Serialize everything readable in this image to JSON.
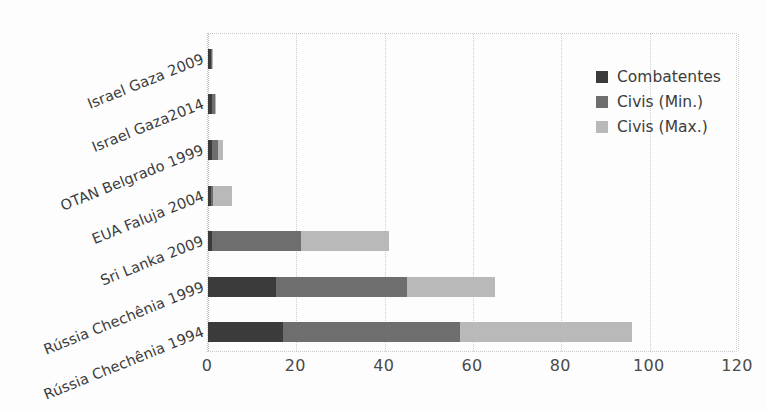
{
  "chart_data": {
    "type": "bar",
    "orientation": "horizontal",
    "stacked": true,
    "title": "",
    "subtitle": "",
    "xlabel": "",
    "ylabel": "",
    "xlim": [
      0,
      120
    ],
    "ylim": null,
    "grid": true,
    "grid_style": "dotted vertical gridlines",
    "legend_position": "top-right inside plot",
    "categories": [
      "Israel Gaza 2009",
      "Israel Gaza2014",
      "OTAN Belgrado 1999",
      "EUA Faluja 2004",
      "Sri Lanka 2009",
      "Rússia Chechênia 1999",
      "Rússia Chechênia 1994"
    ],
    "x_ticks": [
      0,
      20,
      40,
      60,
      80,
      100,
      120
    ],
    "x_tick_labels": [
      "0",
      "20",
      "40",
      "60",
      "80",
      "100",
      "120"
    ],
    "series": [
      {
        "name": "Combatentes",
        "color": "#3b3b3b",
        "values": [
          0.6,
          0.9,
          1.0,
          0.6,
          1.0,
          15.5,
          17.0
        ]
      },
      {
        "name": "Civis (Min.)",
        "color": "#6e6e6e",
        "values": [
          0.4,
          0.6,
          1.2,
          0.6,
          20.0,
          29.5,
          40.0
        ]
      },
      {
        "name": "Civis (Max.)",
        "color": "#b9b9b9",
        "values": [
          0.2,
          0.3,
          1.1,
          4.3,
          20.0,
          20.0,
          39.0
        ]
      }
    ],
    "stack_totals": [
      1.2,
      1.8,
      3.3,
      5.5,
      41.0,
      65.0,
      96.0
    ]
  },
  "legend": {
    "items": [
      {
        "label": "Combatentes",
        "color": "#3b3b3b"
      },
      {
        "label": "Civis (Min.)",
        "color": "#6e6e6e"
      },
      {
        "label": "Civis (Max.)",
        "color": "#b9b9b9"
      }
    ]
  },
  "axis": {
    "x_tick_labels": [
      "0",
      "20",
      "40",
      "60",
      "80",
      "100",
      "120"
    ]
  }
}
